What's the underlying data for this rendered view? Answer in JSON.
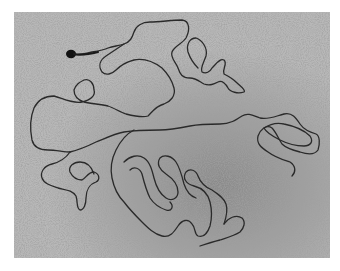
{
  "image": {
    "kind": "electron-micrograph",
    "subject": "single long linear DNA molecule with terminal knob",
    "colors": {
      "background": "#9a9a9a",
      "background_light": "#c8c8c8",
      "strand": "#2a2a2a",
      "frame": "#ffffff"
    }
  }
}
